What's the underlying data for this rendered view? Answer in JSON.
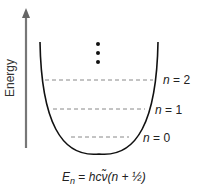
{
  "axis": {
    "label": "Energy"
  },
  "levels": [
    {
      "label_var": "n",
      "label_eq": " = ",
      "label_val": "2"
    },
    {
      "label_var": "n",
      "label_eq": " = ",
      "label_val": "1"
    },
    {
      "label_var": "n",
      "label_eq": " = ",
      "label_val": "0"
    }
  ],
  "continuation": "⋮",
  "formula": {
    "lhs_var": "E",
    "lhs_sub": "n",
    "eq": " = ",
    "rhs": "hcν̃(n + ½)"
  },
  "colors": {
    "curve": "#111111",
    "arrow": "#777777",
    "dashed": "#888888"
  }
}
